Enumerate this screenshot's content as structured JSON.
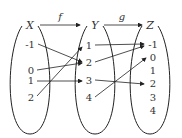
{
  "sets": [
    {
      "name": "X",
      "elements": [
        "-1",
        "0",
        "1",
        "2"
      ],
      "cx": 30
    },
    {
      "name": "Y",
      "elements": [
        "1",
        "2",
        "3",
        "4"
      ],
      "cx": 95
    },
    {
      "name": "Z",
      "elements": [
        "-1",
        "0",
        "1",
        "2",
        "3",
        "4"
      ],
      "cx": 150
    }
  ],
  "functions": [
    {
      "name": "f",
      "from": "X",
      "to": "Y",
      "mapping": [
        [
          "-1",
          "2"
        ],
        [
          "0",
          "2"
        ],
        [
          "1",
          "3"
        ],
        [
          "2",
          "1"
        ]
      ]
    },
    {
      "name": "g",
      "from": "Y",
      "to": "Z",
      "mapping": [
        [
          "1",
          "-1"
        ],
        [
          "2",
          "-1"
        ],
        [
          "3",
          "2"
        ],
        [
          "4",
          "0"
        ]
      ]
    }
  ],
  "colors": {
    "stroke": "#222222",
    "text": "#333333"
  }
}
